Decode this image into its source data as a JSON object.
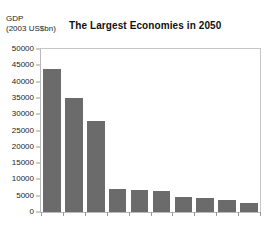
{
  "chart_data": {
    "type": "bar",
    "title": "The Largest Economies in 2050",
    "ylabel_line1": "GDP",
    "ylabel_line2": "(2003 US$bn)",
    "xlabel": "",
    "categories": [
      "",
      "",
      "",
      "",
      "",
      "",
      "",
      "",
      "",
      ""
    ],
    "values": [
      44000,
      35000,
      28000,
      7000,
      6800,
      6500,
      4500,
      4300,
      3800,
      2800
    ],
    "ylim": [
      0,
      50000
    ],
    "ytick_labels": [
      "50000",
      "45000",
      "40000",
      "35000",
      "30000",
      "25000",
      "20000",
      "15000",
      "10000",
      "5000",
      "0"
    ],
    "ytick_values": [
      50000,
      45000,
      40000,
      35000,
      30000,
      25000,
      20000,
      15000,
      10000,
      5000,
      0
    ],
    "grid": false,
    "legend": "none",
    "bar_color": "#6b6b6b",
    "plot_border_color": "#b9b9b9",
    "background_color": "#ffffff",
    "text_color": "#1c1c1c"
  }
}
